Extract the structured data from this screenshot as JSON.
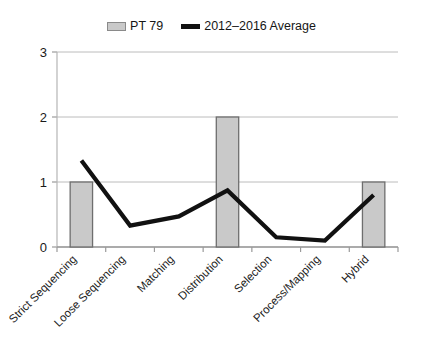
{
  "legend": {
    "entries": [
      {
        "label": "PT 79",
        "marker": "bar-swatch-icon",
        "color": "#c9c9c9"
      },
      {
        "label": "2012–2016 Average",
        "marker": "line-swatch-icon",
        "color": "#111111"
      }
    ]
  },
  "axis": {
    "y_ticks": [
      "0",
      "1",
      "2",
      "3"
    ]
  },
  "chart_data": {
    "type": "bar",
    "title": "",
    "xlabel": "",
    "ylabel": "",
    "ylim": [
      0,
      3
    ],
    "yticks": [
      0,
      1,
      2,
      3
    ],
    "grid": true,
    "legend_position": "top-center",
    "categories": [
      "Strict Sequencing",
      "Loose Sequencing",
      "Matching",
      "Distribution",
      "Selection",
      "Process/Mapping",
      "Hybrid"
    ],
    "series": [
      {
        "name": "PT 79",
        "type": "bar",
        "color": "#c9c9c9",
        "border_color": "#6e6e6e",
        "values": [
          1,
          0,
          0,
          2,
          0,
          0,
          1
        ]
      },
      {
        "name": "2012–2016 Average",
        "type": "line",
        "color": "#111111",
        "values": [
          1.33,
          0.33,
          0.47,
          0.87,
          0.15,
          0.1,
          0.8
        ]
      }
    ]
  }
}
